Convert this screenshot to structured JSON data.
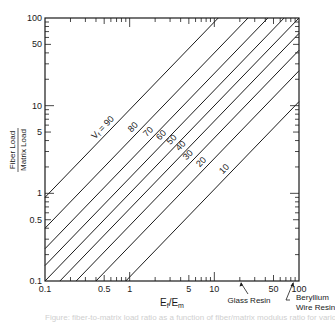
{
  "chart_data": {
    "type": "line",
    "title": "",
    "xlabel": "E_f/E_m",
    "ylabel": "Fiber Load / Matrix Load",
    "ylabel_numerator": "Fiber Load",
    "ylabel_denominator": "Matrix Load",
    "xscale": "log",
    "yscale": "log",
    "xlim": [
      0.1,
      100
    ],
    "ylim": [
      0.1,
      100
    ],
    "grid": false,
    "x_tick_labels": [
      "0.1",
      "0.5",
      "1",
      "5",
      "10",
      "50",
      "100"
    ],
    "x_tick_values": [
      0.1,
      0.5,
      1,
      5,
      10,
      50,
      100
    ],
    "y_tick_labels": [
      "0.1",
      "0.5",
      "1",
      "5",
      "10",
      "50",
      "100"
    ],
    "y_tick_values": [
      0.1,
      0.5,
      1,
      5,
      10,
      50,
      100
    ],
    "relation": "FiberLoad/MatrixLoad = (Ef/Em) * Vf / (100 - Vf)",
    "series": [
      {
        "name": "Vf = 90",
        "label": "Vf = 90",
        "vf": 90,
        "x": [
          0.1,
          0.111
        ],
        "y": [
          0.9,
          1.0
        ],
        "x_end": 11.1,
        "y_end": 100,
        "label_x": 0.55
      },
      {
        "name": "80",
        "label": "80",
        "vf": 80,
        "x": [
          0.25,
          25
        ],
        "y": [
          0.1,
          100
        ],
        "label_x": 1.25
      },
      {
        "name": "70",
        "label": "70",
        "vf": 70,
        "x": [
          0.43,
          42.9
        ],
        "y": [
          0.1,
          100
        ],
        "label_x": 1.9
      },
      {
        "name": "60",
        "label": "60",
        "vf": 60,
        "x": [
          0.667,
          66.7
        ],
        "y": [
          0.1,
          100
        ],
        "label_x": 2.7
      },
      {
        "name": "50",
        "label": "50",
        "vf": 50,
        "x": [
          1,
          100
        ],
        "y": [
          0.1,
          100
        ],
        "label_x": 3.6
      },
      {
        "name": "40",
        "label": "40",
        "vf": 40,
        "x": [
          1.5,
          100
        ],
        "y": [
          0.1,
          66.7
        ],
        "label_x": 4.6
      },
      {
        "name": "30",
        "label": "30",
        "vf": 30,
        "x": [
          2.33,
          100
        ],
        "y": [
          0.1,
          42.9
        ],
        "label_x": 5.6
      },
      {
        "name": "20",
        "label": "20",
        "vf": 20,
        "x": [
          4,
          100
        ],
        "y": [
          0.1,
          25
        ],
        "label_x": 8.0
      },
      {
        "name": "10",
        "label": "10",
        "vf": 10,
        "x": [
          9,
          100
        ],
        "y": [
          0.1,
          11.1
        ],
        "label_x": 15
      }
    ],
    "annotations": [
      {
        "text": "Glass Resin",
        "x": 20,
        "type": "arrow-to-x-axis"
      },
      {
        "text": "Beryllium Wire Resin",
        "line1": "Beryllium",
        "line2": "Wire Resin",
        "x": 85,
        "type": "arrow-to-x-axis"
      }
    ]
  },
  "plot": {
    "left": 45,
    "right": 299,
    "top": 18,
    "bottom": 281,
    "line_color": "#1a1a1a",
    "axis_color": "#1a1a1a"
  },
  "caption": "Figure: fiber-to-matrix load ratio as a function of fiber/matrix modulus ratio for various fiber volume fractions"
}
